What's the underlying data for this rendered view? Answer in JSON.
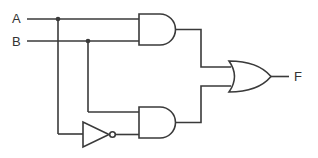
{
  "diagram": {
    "type": "logic-circuit",
    "inputs": [
      {
        "label": "A"
      },
      {
        "label": "B"
      }
    ],
    "output": {
      "label": "F"
    },
    "gates": [
      {
        "id": "and1",
        "type": "AND",
        "inputs": [
          "A",
          "B"
        ]
      },
      {
        "id": "not1",
        "type": "NOT",
        "inputs": [
          "A"
        ]
      },
      {
        "id": "and2",
        "type": "AND",
        "inputs": [
          "B",
          "NOT A"
        ]
      },
      {
        "id": "or1",
        "type": "OR",
        "inputs": [
          "and1",
          "and2"
        ],
        "output": "F"
      }
    ],
    "colors": {
      "wire": "#3a3a3a",
      "background": "#ffffff"
    }
  }
}
